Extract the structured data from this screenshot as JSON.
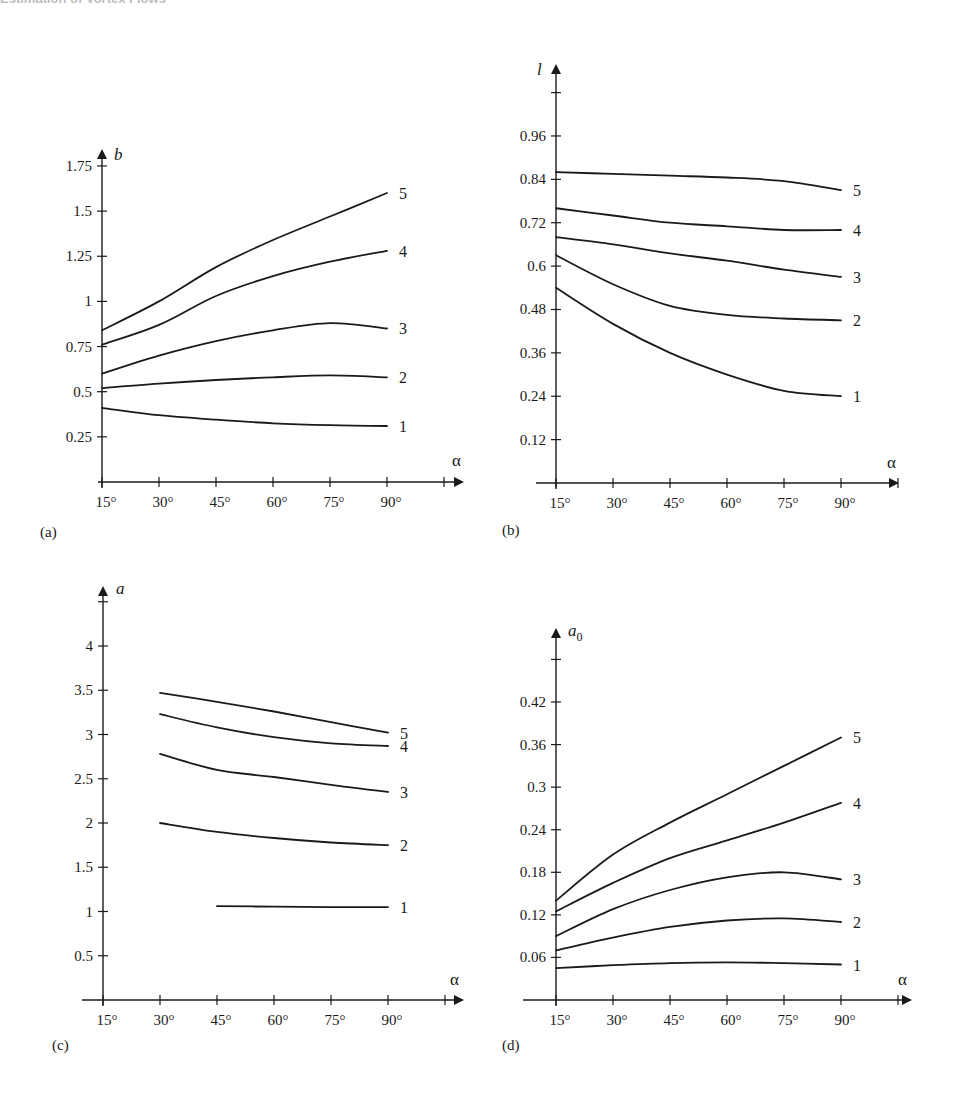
{
  "page": {
    "header_fragment": "Estimation of Vortex Flows",
    "footer_fragment": ""
  },
  "chart_data": [
    {
      "id": "a",
      "type": "line",
      "panel_label": "(a)",
      "title": "",
      "xlabel": "α",
      "ylabel": "b",
      "ylabel_sub": "",
      "x": [
        15,
        30,
        45,
        60,
        75,
        90
      ],
      "x_tick_labels": [
        "15°",
        "30°",
        "45°",
        "60°",
        "75°",
        "90°"
      ],
      "y_ticks": [
        0.25,
        0.5,
        0.75,
        1,
        1.25,
        1.5,
        1.75
      ],
      "y_tick_labels": [
        "0.25",
        "0.5",
        "0.75",
        "1",
        "1.25",
        "1.5",
        "1.75"
      ],
      "ylim": [
        0,
        1.75
      ],
      "grid": false,
      "legend": "inline curve numbers at right end",
      "series": [
        {
          "name": "1",
          "values": [
            0.41,
            0.37,
            0.345,
            0.325,
            0.315,
            0.31
          ]
        },
        {
          "name": "2",
          "values": [
            0.52,
            0.545,
            0.565,
            0.58,
            0.59,
            0.58
          ]
        },
        {
          "name": "3",
          "values": [
            0.6,
            0.7,
            0.78,
            0.84,
            0.88,
            0.85
          ]
        },
        {
          "name": "4",
          "values": [
            0.76,
            0.87,
            1.03,
            1.14,
            1.22,
            1.28
          ]
        },
        {
          "name": "5",
          "values": [
            0.84,
            1.0,
            1.19,
            1.34,
            1.47,
            1.6
          ]
        }
      ],
      "layout": {
        "x0": 102,
        "dx": 57,
        "y0": 482,
        "yscale": 180.6,
        "ytop_arrow": 143,
        "extra_ticks_above": 0,
        "xaxis_start": 98,
        "xaxis_end": 470,
        "extra_x_tick": true,
        "label_pos": [
          40,
          537
        ],
        "ylabel_pos": [
          114,
          160
        ],
        "alpha_pos": [
          452,
          466
        ]
      }
    },
    {
      "id": "b",
      "type": "line",
      "panel_label": "(b)",
      "title": "",
      "xlabel": "α",
      "ylabel": "l",
      "ylabel_sub": "",
      "x": [
        15,
        30,
        45,
        60,
        75,
        90
      ],
      "x_tick_labels": [
        "15°",
        "30°",
        "45°",
        "60°",
        "75°",
        "90°"
      ],
      "y_ticks": [
        0.12,
        0.24,
        0.36,
        0.48,
        0.6,
        0.72,
        0.84,
        0.96
      ],
      "y_tick_labels": [
        "0.12",
        "0.24",
        "0.36",
        "0.48",
        "0.6",
        "0.72",
        "0.84",
        "0.96"
      ],
      "ylim": [
        0,
        1.08
      ],
      "grid": false,
      "legend": "inline curve numbers at right end",
      "series": [
        {
          "name": "1",
          "values": [
            0.54,
            0.44,
            0.36,
            0.3,
            0.255,
            0.24
          ]
        },
        {
          "name": "2",
          "values": [
            0.63,
            0.55,
            0.49,
            0.465,
            0.455,
            0.45
          ]
        },
        {
          "name": "3",
          "values": [
            0.68,
            0.66,
            0.635,
            0.615,
            0.59,
            0.57
          ]
        },
        {
          "name": "4",
          "values": [
            0.76,
            0.74,
            0.72,
            0.71,
            0.7,
            0.7
          ]
        },
        {
          "name": "5",
          "values": [
            0.86,
            0.855,
            0.85,
            0.845,
            0.835,
            0.81
          ]
        }
      ],
      "layout": {
        "x0": 556,
        "dx": 57,
        "y0": 483,
        "yscale": 361.5,
        "ytop_arrow": 58,
        "extra_ticks_above": 1,
        "xaxis_start": 536,
        "xaxis_end": 905,
        "extra_x_tick": true,
        "label_pos": [
          502,
          535
        ],
        "ylabel_pos": [
          537,
          75
        ],
        "alpha_pos": [
          887,
          468
        ]
      }
    },
    {
      "id": "c",
      "type": "line",
      "panel_label": "(c)",
      "title": "",
      "xlabel": "α",
      "ylabel": "a",
      "ylabel_sub": "",
      "x": [
        15,
        30,
        45,
        60,
        75,
        90
      ],
      "x_tick_labels": [
        "15°",
        "30°",
        "45°",
        "60°",
        "75°",
        "90°"
      ],
      "y_ticks": [
        0.5,
        1,
        1.5,
        2,
        2.5,
        3,
        3.5,
        4
      ],
      "y_tick_labels": [
        "0.5",
        "1",
        "1.5",
        "2",
        "2.5",
        "3",
        "3.5",
        "4"
      ],
      "ylim": [
        0,
        4.5
      ],
      "grid": false,
      "legend": "inline curve numbers at right end",
      "series": [
        {
          "name": "1",
          "values": [
            null,
            null,
            1.06,
            1.055,
            1.05,
            1.05
          ]
        },
        {
          "name": "2",
          "values": [
            null,
            2.0,
            1.9,
            1.83,
            1.78,
            1.75
          ]
        },
        {
          "name": "3",
          "values": [
            null,
            2.78,
            2.6,
            2.52,
            2.43,
            2.35
          ]
        },
        {
          "name": "4",
          "values": [
            null,
            3.23,
            3.08,
            2.97,
            2.9,
            2.87
          ]
        },
        {
          "name": "5",
          "values": [
            null,
            3.47,
            3.37,
            3.26,
            3.14,
            3.02
          ]
        }
      ],
      "layout": {
        "x0": 103,
        "dx": 57,
        "y0": 1000,
        "yscale": 88.5,
        "ytop_arrow": 580,
        "extra_ticks_above": 1,
        "xaxis_start": 82,
        "xaxis_end": 470,
        "extra_x_tick": true,
        "label_pos": [
          52,
          1050
        ],
        "ylabel_pos": [
          116,
          594
        ],
        "alpha_pos": [
          450,
          985
        ]
      }
    },
    {
      "id": "d",
      "type": "line",
      "panel_label": "(d)",
      "title": "",
      "xlabel": "α",
      "ylabel": "a",
      "ylabel_sub": "0",
      "x": [
        15,
        30,
        45,
        60,
        75,
        90
      ],
      "x_tick_labels": [
        "15°",
        "30°",
        "45°",
        "60°",
        "75°",
        "90°"
      ],
      "y_ticks": [
        0.06,
        0.12,
        0.18,
        0.24,
        0.3,
        0.36,
        0.42
      ],
      "y_tick_labels": [
        "0.06",
        "0.12",
        "0.18",
        "0.24",
        "0.3",
        "0.36",
        "0.42"
      ],
      "ylim": [
        0,
        0.48
      ],
      "grid": false,
      "legend": "inline curve numbers at right end",
      "series": [
        {
          "name": "1",
          "values": [
            0.045,
            0.049,
            0.052,
            0.053,
            0.052,
            0.05
          ]
        },
        {
          "name": "2",
          "values": [
            0.07,
            0.088,
            0.103,
            0.112,
            0.115,
            0.11
          ]
        },
        {
          "name": "3",
          "values": [
            0.09,
            0.128,
            0.155,
            0.173,
            0.18,
            0.17
          ]
        },
        {
          "name": "4",
          "values": [
            0.125,
            0.165,
            0.2,
            0.225,
            0.25,
            0.278
          ]
        },
        {
          "name": "5",
          "values": [
            0.14,
            0.205,
            0.25,
            0.29,
            0.33,
            0.37
          ]
        }
      ],
      "layout": {
        "x0": 556,
        "dx": 57,
        "y0": 1000,
        "yscale": 709.5,
        "ytop_arrow": 622,
        "extra_ticks_above": 1,
        "xaxis_start": 523,
        "xaxis_end": 918,
        "extra_x_tick": true,
        "label_pos": [
          502,
          1050
        ],
        "ylabel_pos": [
          568,
          636
        ],
        "alpha_pos": [
          898,
          985
        ]
      }
    }
  ]
}
